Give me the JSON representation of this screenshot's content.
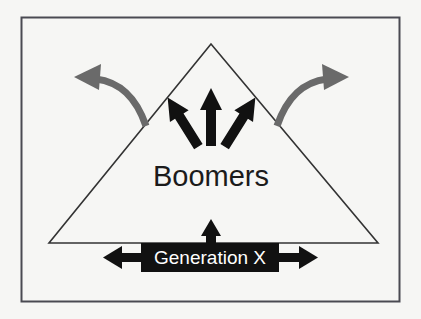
{
  "figure": {
    "name": "generational-pressure-diagram",
    "background_color": "#f6f6f4",
    "border_color": "#4a4a52",
    "triangle_outline_color": "#333333",
    "inward_arrow_color": "#111111",
    "outward_arrow_color": "#6a6a6a",
    "banner_fill_color": "#111111",
    "banner_text_color": "#ffffff"
  },
  "labels": {
    "triangle_label": "Boomers",
    "banner_label": "Generation X"
  },
  "shapes": {
    "outer_border": {
      "x": 21,
      "y": 17,
      "width": 379,
      "height": 285
    },
    "triangle": {
      "apex_x": 211,
      "apex_y": 44,
      "left_x": 49,
      "right_x": 378,
      "base_y": 243
    },
    "banner": {
      "x": 141,
      "y": 243,
      "width": 138,
      "height": 29
    },
    "left_banner_arrow_tip_x": 103,
    "right_banner_arrow_tip_x": 318
  },
  "icons": {
    "inward_arrow_left": "arrow-up-right-icon",
    "inward_arrow_center": "arrow-up-icon",
    "inward_arrow_right": "arrow-up-left-icon",
    "outward_arrow_left": "curved-arrow-left-icon",
    "outward_arrow_right": "curved-arrow-right-icon",
    "banner_arrow_up": "arrow-up-small-icon",
    "banner_arrow_left": "arrow-left-icon",
    "banner_arrow_right": "arrow-right-icon"
  }
}
